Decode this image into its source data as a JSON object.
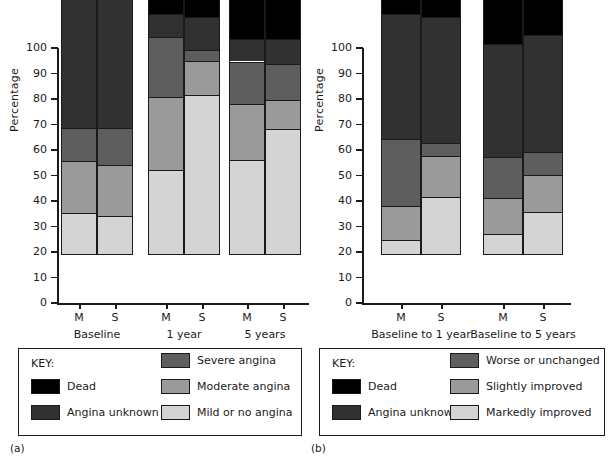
{
  "figure": {
    "panels": [
      {
        "tag": "(a)",
        "ylabel": "Percentage"
      },
      {
        "tag": "(b)",
        "ylabel": "Percentage"
      }
    ]
  },
  "axis": {
    "yticks": [
      "0",
      "10",
      "20",
      "30",
      "40",
      "50",
      "60",
      "70",
      "80",
      "90",
      "100"
    ],
    "ylabel": "Percentage",
    "ymin": 0,
    "ymax": 100
  },
  "legend_a": {
    "title": "KEY:",
    "items": [
      {
        "label": "Dead",
        "color": "#000000"
      },
      {
        "label": "Angina unknown",
        "color": "#313131"
      },
      {
        "label": "Severe angina",
        "color": "#5e5e5e"
      },
      {
        "label": "Moderate angina",
        "color": "#9a9a9a"
      },
      {
        "label": "Mild or no angina",
        "color": "#d4d4d4"
      }
    ]
  },
  "legend_b": {
    "title": "KEY:",
    "items": [
      {
        "label": "Dead",
        "color": "#000000"
      },
      {
        "label": "Angina unknown",
        "color": "#313131"
      },
      {
        "label": "Worse or unchanged",
        "color": "#5e5e5e"
      },
      {
        "label": "Slightly improved",
        "color": "#9a9a9a"
      },
      {
        "label": "Markedly improved",
        "color": "#d4d4d4"
      }
    ]
  },
  "chart_data": [
    {
      "type": "bar",
      "id": "panel-a",
      "title": "",
      "xlabel": "",
      "ylabel": "Percentage",
      "ylim": [
        0,
        100
      ],
      "stacked": true,
      "grid": false,
      "legend_position": "below",
      "groups": [
        {
          "label": "Baseline",
          "pvalue": "p = 0.72"
        },
        {
          "label": "1 year",
          "pvalue": "p = 0.0001"
        },
        {
          "label": "5 years",
          "pvalue": "p = 0.0014"
        }
      ],
      "categories": [
        "Baseline M",
        "Baseline S",
        "1 year M",
        "1 year S",
        "5 years M",
        "5 years S"
      ],
      "bar_labels": [
        "M",
        "S",
        "M",
        "S",
        "M",
        "S"
      ],
      "series": [
        {
          "name": "Mild or no angina",
          "color": "#d4d4d4",
          "values": [
            16,
            15,
            33,
            62.5,
            37,
            49
          ]
        },
        {
          "name": "Moderate angina",
          "color": "#9a9a9a",
          "values": [
            20.5,
            20,
            28.5,
            13,
            22,
            11.5
          ]
        },
        {
          "name": "Severe angina",
          "color": "#5e5e5e",
          "values": [
            13,
            14.5,
            23.5,
            4.5,
            16.5,
            14
          ]
        },
        {
          "name": "Angina unknown",
          "color": "#313131",
          "values": [
            50.5,
            50.5,
            9,
            13,
            9,
            10
          ]
        },
        {
          "name": "Dead",
          "color": "#000000",
          "values": [
            0,
            0,
            6,
            7,
            15.5,
            15.5
          ]
        }
      ]
    },
    {
      "type": "bar",
      "id": "panel-b",
      "title": "",
      "xlabel": "",
      "ylabel": "Percentage",
      "ylim": [
        0,
        100
      ],
      "stacked": true,
      "grid": false,
      "legend_position": "below",
      "groups": [
        {
          "label": "Baseline to 1 year",
          "pvalue": "p = 0.0001"
        },
        {
          "label": "Baseline to 5 years",
          "pvalue": "p = 0.0002"
        }
      ],
      "categories": [
        "Baseline to 1 year M",
        "Baseline to 1 year S",
        "Baseline to 5 years M",
        "Baseline to 5 years S"
      ],
      "bar_labels": [
        "M",
        "S",
        "M",
        "S"
      ],
      "series": [
        {
          "name": "Markedly improved",
          "color": "#d4d4d4",
          "values": [
            5.5,
            22.5,
            8,
            16.5
          ]
        },
        {
          "name": "Slightly improved",
          "color": "#9a9a9a",
          "values": [
            13.5,
            16,
            14,
            14.5
          ]
        },
        {
          "name": "Worse or unchanged",
          "color": "#5e5e5e",
          "values": [
            26,
            5,
            16,
            9
          ]
        },
        {
          "name": "Angina unknown",
          "color": "#313131",
          "values": [
            49,
            49.5,
            44.5,
            46
          ]
        },
        {
          "name": "Dead",
          "color": "#000000",
          "values": [
            6,
            7,
            17.5,
            14
          ]
        }
      ]
    }
  ]
}
